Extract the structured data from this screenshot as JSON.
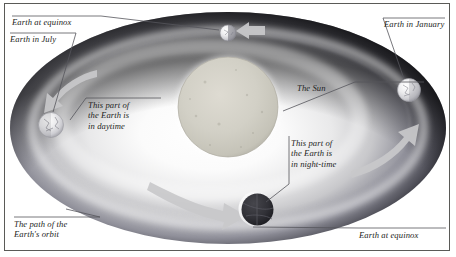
{
  "diagram": {
    "type": "astronomy-orbit-diagram",
    "style": "grayscale airbrush illustration",
    "frame_color": "#5a5a57",
    "background_color": "#ffffff",
    "text_color": "#1d1d22",
    "leader_line_color": "#4a4a50",
    "arrow_color": "#c9c9c9",
    "orbit": {
      "shape": "ellipse",
      "center": [
        228,
        128
      ],
      "rx": 218,
      "ry": 116,
      "outer_band_color": "#0b0b0d",
      "inner_glow_color": "#ffffff",
      "mid_tone_color": "#b9b9bc"
    },
    "sun": {
      "label": "The Sun",
      "center": [
        228,
        107
      ],
      "radius": 50,
      "color": "#cfcdc4",
      "edge_color": "#b4b2a8"
    },
    "earths": [
      {
        "name": "earth-at-equinox-top",
        "position": [
          228,
          33
        ],
        "radius": 8,
        "lit": "left-half",
        "label_ref": "earth_at_equinox_top"
      },
      {
        "name": "earth-in-january",
        "position": [
          409,
          90
        ],
        "radius": 11,
        "lit": "full-bright",
        "label_ref": "earth_in_january"
      },
      {
        "name": "earth-at-equinox-bottom",
        "position": [
          256,
          209
        ],
        "radius": 17,
        "lit": "dark-night-side",
        "label_ref": "earth_at_equinox_bottom"
      },
      {
        "name": "earth-in-july",
        "position": [
          51,
          125
        ],
        "radius": 12,
        "lit": "full-bright",
        "label_ref": "earth_in_july"
      }
    ],
    "arrows": [
      {
        "name": "arrow-top-right",
        "direction": "left",
        "position": [
          248,
          31
        ]
      },
      {
        "name": "arrow-upper-left",
        "direction": "down-left",
        "position": [
          62,
          96
        ]
      },
      {
        "name": "arrow-bottom",
        "direction": "right-down",
        "position": [
          205,
          208
        ]
      },
      {
        "name": "arrow-right",
        "direction": "up-right",
        "position": [
          408,
          135
        ]
      }
    ]
  },
  "labels": {
    "earth_at_equinox_top": "Earth at equinox",
    "earth_in_july": "Earth in July",
    "earth_in_january": "Earth in January",
    "the_sun": "The Sun",
    "daytime": "This part of\nthe Earth is\nin daytime",
    "nighttime": "This part of\nthe Earth is\nin night-time",
    "orbit_path": "The path of the\nEarth's orbit",
    "earth_at_equinox_bottom": "Earth at equinox"
  }
}
